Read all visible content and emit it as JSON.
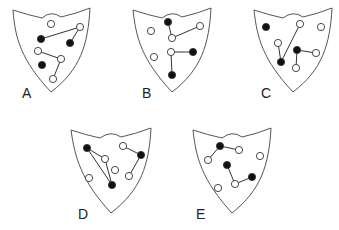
{
  "colors": {
    "outline": "#555555",
    "filled": "#111111",
    "open_fill": "#ffffff",
    "background": "#ffffff"
  },
  "shields": [
    {
      "label": "A",
      "label_pos": [
        22,
        98
      ],
      "outline": [
        [
          13,
          10
        ],
        [
          28,
          14
        ],
        [
          42,
          18
        ],
        [
          51,
          12
        ],
        [
          61,
          17
        ],
        [
          75,
          12
        ],
        [
          90,
          8
        ],
        [
          88,
          45
        ],
        [
          80,
          70
        ],
        [
          66,
          84
        ],
        [
          51,
          92
        ],
        [
          34,
          78
        ],
        [
          21,
          60
        ],
        [
          15,
          38
        ]
      ],
      "dots": [
        {
          "x": 51,
          "y": 24,
          "filled": false
        },
        {
          "x": 80,
          "y": 27,
          "filled": false
        },
        {
          "x": 41,
          "y": 39,
          "filled": true
        },
        {
          "x": 70,
          "y": 43,
          "filled": true
        },
        {
          "x": 38,
          "y": 51,
          "filled": false
        },
        {
          "x": 61,
          "y": 59,
          "filled": false
        },
        {
          "x": 42,
          "y": 65,
          "filled": true
        },
        {
          "x": 53,
          "y": 79,
          "filled": false
        }
      ],
      "lines": [
        [
          41,
          39,
          80,
          27
        ],
        [
          80,
          27,
          70,
          43
        ],
        [
          38,
          51,
          61,
          59
        ],
        [
          61,
          59,
          53,
          79
        ]
      ]
    },
    {
      "label": "B",
      "label_pos": [
        142,
        98
      ],
      "outline": [
        [
          133,
          10
        ],
        [
          148,
          14
        ],
        [
          162,
          18
        ],
        [
          172,
          12
        ],
        [
          182,
          17
        ],
        [
          196,
          12
        ],
        [
          211,
          8
        ],
        [
          209,
          45
        ],
        [
          201,
          70
        ],
        [
          187,
          84
        ],
        [
          172,
          92
        ],
        [
          155,
          78
        ],
        [
          142,
          60
        ],
        [
          136,
          38
        ]
      ],
      "dots": [
        {
          "x": 168,
          "y": 22,
          "filled": true
        },
        {
          "x": 151,
          "y": 31,
          "filled": false
        },
        {
          "x": 200,
          "y": 26,
          "filled": false
        },
        {
          "x": 172,
          "y": 38,
          "filled": false
        },
        {
          "x": 171,
          "y": 52,
          "filled": false
        },
        {
          "x": 193,
          "y": 52,
          "filled": true
        },
        {
          "x": 154,
          "y": 57,
          "filled": false
        },
        {
          "x": 172,
          "y": 75,
          "filled": true
        }
      ],
      "lines": [
        [
          168,
          22,
          172,
          38
        ],
        [
          172,
          38,
          200,
          26
        ],
        [
          171,
          52,
          193,
          52
        ],
        [
          171,
          52,
          172,
          75
        ]
      ]
    },
    {
      "label": "C",
      "label_pos": [
        261,
        98
      ],
      "outline": [
        [
          254,
          10
        ],
        [
          269,
          14
        ],
        [
          283,
          18
        ],
        [
          293,
          12
        ],
        [
          303,
          17
        ],
        [
          317,
          12
        ],
        [
          332,
          8
        ],
        [
          330,
          45
        ],
        [
          322,
          70
        ],
        [
          308,
          84
        ],
        [
          293,
          92
        ],
        [
          276,
          78
        ],
        [
          263,
          60
        ],
        [
          257,
          38
        ]
      ],
      "dots": [
        {
          "x": 266,
          "y": 27,
          "filled": true
        },
        {
          "x": 300,
          "y": 24,
          "filled": false
        },
        {
          "x": 321,
          "y": 27,
          "filled": false
        },
        {
          "x": 278,
          "y": 43,
          "filled": false
        },
        {
          "x": 297,
          "y": 50,
          "filled": true
        },
        {
          "x": 316,
          "y": 53,
          "filled": false
        },
        {
          "x": 281,
          "y": 62,
          "filled": true
        },
        {
          "x": 296,
          "y": 68,
          "filled": false
        }
      ],
      "lines": [
        [
          281,
          62,
          278,
          43
        ],
        [
          281,
          62,
          300,
          24
        ],
        [
          297,
          50,
          316,
          53
        ],
        [
          297,
          50,
          296,
          68
        ]
      ]
    },
    {
      "label": "D",
      "label_pos": [
        78,
        219
      ],
      "outline": [
        [
          71,
          130
        ],
        [
          86,
          134
        ],
        [
          100,
          138
        ],
        [
          111,
          132
        ],
        [
          121,
          137
        ],
        [
          135,
          132
        ],
        [
          151,
          128
        ],
        [
          149,
          165
        ],
        [
          141,
          190
        ],
        [
          127,
          205
        ],
        [
          111,
          213
        ],
        [
          94,
          199
        ],
        [
          81,
          180
        ],
        [
          75,
          158
        ]
      ],
      "dots": [
        {
          "x": 87,
          "y": 148,
          "filled": true
        },
        {
          "x": 123,
          "y": 146,
          "filled": false
        },
        {
          "x": 141,
          "y": 155,
          "filled": true
        },
        {
          "x": 105,
          "y": 159,
          "filled": false
        },
        {
          "x": 115,
          "y": 170,
          "filled": false
        },
        {
          "x": 129,
          "y": 176,
          "filled": false
        },
        {
          "x": 89,
          "y": 178,
          "filled": false
        },
        {
          "x": 112,
          "y": 185,
          "filled": true
        }
      ],
      "lines": [
        [
          87,
          148,
          105,
          159
        ],
        [
          87,
          148,
          112,
          185
        ],
        [
          105,
          159,
          112,
          185
        ],
        [
          123,
          146,
          141,
          155
        ],
        [
          141,
          155,
          129,
          176
        ]
      ]
    },
    {
      "label": "E",
      "label_pos": [
        196,
        219
      ],
      "outline": [
        [
          193,
          130
        ],
        [
          208,
          134
        ],
        [
          222,
          138
        ],
        [
          232,
          132
        ],
        [
          242,
          137
        ],
        [
          256,
          132
        ],
        [
          271,
          128
        ],
        [
          269,
          165
        ],
        [
          261,
          190
        ],
        [
          247,
          205
        ],
        [
          232,
          213
        ],
        [
          215,
          199
        ],
        [
          202,
          180
        ],
        [
          196,
          158
        ]
      ],
      "dots": [
        {
          "x": 220,
          "y": 146,
          "filled": true
        },
        {
          "x": 239,
          "y": 150,
          "filled": false
        },
        {
          "x": 208,
          "y": 160,
          "filled": false
        },
        {
          "x": 260,
          "y": 156,
          "filled": false
        },
        {
          "x": 227,
          "y": 165,
          "filled": true
        },
        {
          "x": 252,
          "y": 177,
          "filled": true
        },
        {
          "x": 235,
          "y": 184,
          "filled": false
        },
        {
          "x": 218,
          "y": 188,
          "filled": false
        }
      ],
      "lines": [
        [
          220,
          146,
          239,
          150
        ],
        [
          220,
          146,
          208,
          160
        ],
        [
          227,
          165,
          235,
          184
        ],
        [
          235,
          184,
          252,
          177
        ]
      ]
    }
  ]
}
